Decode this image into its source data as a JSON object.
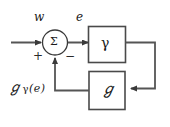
{
  "diagram": {
    "background_color": "#ffffff",
    "line_color": "#555555",
    "text_color": "#1a1a1a",
    "signals": {
      "input_label": "w",
      "error_label": "e",
      "output_label_script_g": "ℊ",
      "output_label_gamma": "γ",
      "output_label_arg": "(e)"
    },
    "summing_junction": {
      "symbol": "Σ",
      "positive_sign": "+",
      "negative_sign": "−"
    },
    "blocks": [
      {
        "id": "forward",
        "symbol": "γ"
      },
      {
        "id": "feedback",
        "symbol": "ℊ"
      }
    ]
  }
}
